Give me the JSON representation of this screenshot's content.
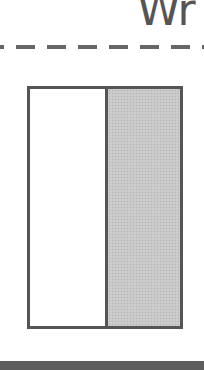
{
  "heading": {
    "text_fragment": "Wr"
  },
  "diagram": {
    "divider_style": "dashed",
    "box": {
      "panels": [
        {
          "name": "left",
          "fill": "#ffffff"
        },
        {
          "name": "right",
          "fill": "#c8c8c8",
          "pattern": "stippled"
        }
      ],
      "border_color": "#555555"
    }
  },
  "colors": {
    "text": "#555555",
    "dash": "#666666",
    "bottom_bar": "#5e5e5e"
  }
}
